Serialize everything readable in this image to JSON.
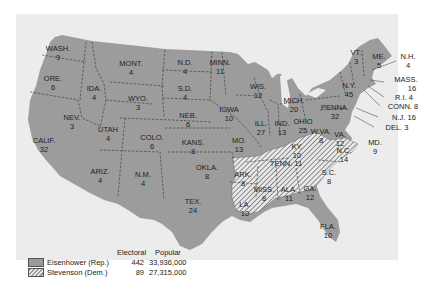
{
  "map": {
    "title": "1952 Presidential Election",
    "colors": {
      "republican": "#9a9a9a",
      "democrat_hatch": "#9a9a9a",
      "background": "#ececec",
      "border": "#333333"
    },
    "states": [
      {
        "abbr": "WASH.",
        "ev": "9",
        "party": "Rep",
        "x": 58,
        "y": 44
      },
      {
        "abbr": "ORE.",
        "ev": "6",
        "party": "Rep",
        "x": 53,
        "y": 75
      },
      {
        "abbr": "IDA.",
        "ev": "4",
        "party": "Rep",
        "x": 94,
        "y": 85
      },
      {
        "abbr": "MONT.",
        "ev": "4",
        "party": "Rep",
        "x": 131,
        "y": 60
      },
      {
        "abbr": "WYO.",
        "ev": "3",
        "party": "Rep",
        "x": 138,
        "y": 95
      },
      {
        "abbr": "N.D.",
        "ev": "4",
        "party": "Rep",
        "x": 185,
        "y": 59
      },
      {
        "abbr": "S.D.",
        "ev": "4",
        "party": "Rep",
        "x": 185,
        "y": 85
      },
      {
        "abbr": "NEB.",
        "ev": "6",
        "party": "Rep",
        "x": 188,
        "y": 112
      },
      {
        "abbr": "KANS.",
        "ev": "8",
        "party": "Rep",
        "x": 193,
        "y": 139
      },
      {
        "abbr": "OKLA.",
        "ev": "8",
        "party": "Rep",
        "x": 207,
        "y": 164
      },
      {
        "abbr": "TEX.",
        "ev": "24",
        "party": "Rep",
        "x": 193,
        "y": 198
      },
      {
        "abbr": "NEV.",
        "ev": "3",
        "party": "Rep",
        "x": 72,
        "y": 114
      },
      {
        "abbr": "CALIF.",
        "ev": "32",
        "party": "Rep",
        "x": 44,
        "y": 137
      },
      {
        "abbr": "UTAH",
        "ev": "4",
        "party": "Rep",
        "x": 108,
        "y": 126
      },
      {
        "abbr": "COLO.",
        "ev": "6",
        "party": "Rep",
        "x": 152,
        "y": 134
      },
      {
        "abbr": "ARIZ.",
        "ev": "4",
        "party": "Rep",
        "x": 100,
        "y": 168
      },
      {
        "abbr": "N.M.",
        "ev": "4",
        "party": "Rep",
        "x": 143,
        "y": 171
      },
      {
        "abbr": "MINN.",
        "ev": "11",
        "party": "Rep",
        "x": 220,
        "y": 59
      },
      {
        "abbr": "IOWA",
        "ev": "10",
        "party": "Rep",
        "x": 229,
        "y": 106
      },
      {
        "abbr": "MO.",
        "ev": "13",
        "party": "Rep",
        "x": 239,
        "y": 137
      },
      {
        "abbr": "WIS.",
        "ev": "12",
        "party": "Rep",
        "x": 258,
        "y": 83
      },
      {
        "abbr": "ILL.",
        "ev": "27",
        "party": "Rep",
        "x": 261,
        "y": 120
      },
      {
        "abbr": "MICH.",
        "ev": "20",
        "party": "Rep",
        "x": 294,
        "y": 97
      },
      {
        "abbr": "IND.",
        "ev": "13",
        "party": "Rep",
        "x": 282,
        "y": 120
      },
      {
        "abbr": "OHIO",
        "ev": "25",
        "party": "Rep",
        "x": 303,
        "y": 118
      },
      {
        "abbr": "KY.",
        "ev": "10",
        "party": "Dem",
        "x": 297,
        "y": 143
      },
      {
        "abbr": "W.VA.",
        "ev": "8",
        "party": "Dem",
        "x": 321,
        "y": 128
      },
      {
        "abbr": "VA.",
        "ev": "12",
        "party": "Rep",
        "x": 340,
        "y": 131
      },
      {
        "abbr": "PENNA.",
        "ev": "32",
        "party": "Rep",
        "x": 335,
        "y": 104
      },
      {
        "abbr": "N.Y.",
        "ev": "45",
        "party": "Rep",
        "x": 349,
        "y": 82
      },
      {
        "abbr": "VT.",
        "ev": "3",
        "party": "Rep",
        "x": 356,
        "y": 49
      },
      {
        "abbr": "ME.",
        "ev": "5",
        "party": "Rep",
        "x": 379,
        "y": 53
      },
      {
        "abbr": "TENN.",
        "ev": "11",
        "party": "Dem",
        "x": 286,
        "y": 160
      },
      {
        "abbr": "N.C.",
        "ev": "14",
        "party": "Dem",
        "x": 344,
        "y": 147
      },
      {
        "abbr": "S.C.",
        "ev": "8",
        "party": "Dem",
        "x": 329,
        "y": 169
      },
      {
        "abbr": "ARK.",
        "ev": "8",
        "party": "Dem",
        "x": 243,
        "y": 171
      },
      {
        "abbr": "MISS.",
        "ev": "8",
        "party": "Dem",
        "x": 264,
        "y": 186
      },
      {
        "abbr": "ALA.",
        "ev": "11",
        "party": "Dem",
        "x": 289,
        "y": 186
      },
      {
        "abbr": "GA.",
        "ev": "12",
        "party": "Dem",
        "x": 310,
        "y": 185
      },
      {
        "abbr": "LA.",
        "ev": "10",
        "party": "Dem",
        "x": 245,
        "y": 201
      },
      {
        "abbr": "FLA.",
        "ev": "10",
        "party": "Rep",
        "x": 328,
        "y": 223
      }
    ],
    "callouts": [
      {
        "text": "N.H.",
        "ev": "4",
        "x": 408,
        "y": 56
      },
      {
        "text": "MASS.",
        "ev": "16",
        "x": 405,
        "y": 79
      },
      {
        "text": "R.I. 4",
        "x": 404,
        "y": 97
      },
      {
        "text": "CONN. 8",
        "x": 402,
        "y": 106
      },
      {
        "text": "N.J. 16",
        "x": 403,
        "y": 117
      },
      {
        "text": "DEL. 3",
        "x": 396,
        "y": 127
      },
      {
        "text": "MD.",
        "ev": "9",
        "x": 374,
        "y": 141
      }
    ]
  },
  "legend": {
    "col_electoral": "Electoral",
    "col_popular": "Popular",
    "rows": [
      {
        "name": "Eisenhower (Rep.)",
        "electoral": "442",
        "popular": "33,936,000",
        "swatch": "solid"
      },
      {
        "name": "Stevenson (Dem.)",
        "electoral": "89",
        "popular": "27,315,000",
        "swatch": "hatched"
      }
    ]
  }
}
